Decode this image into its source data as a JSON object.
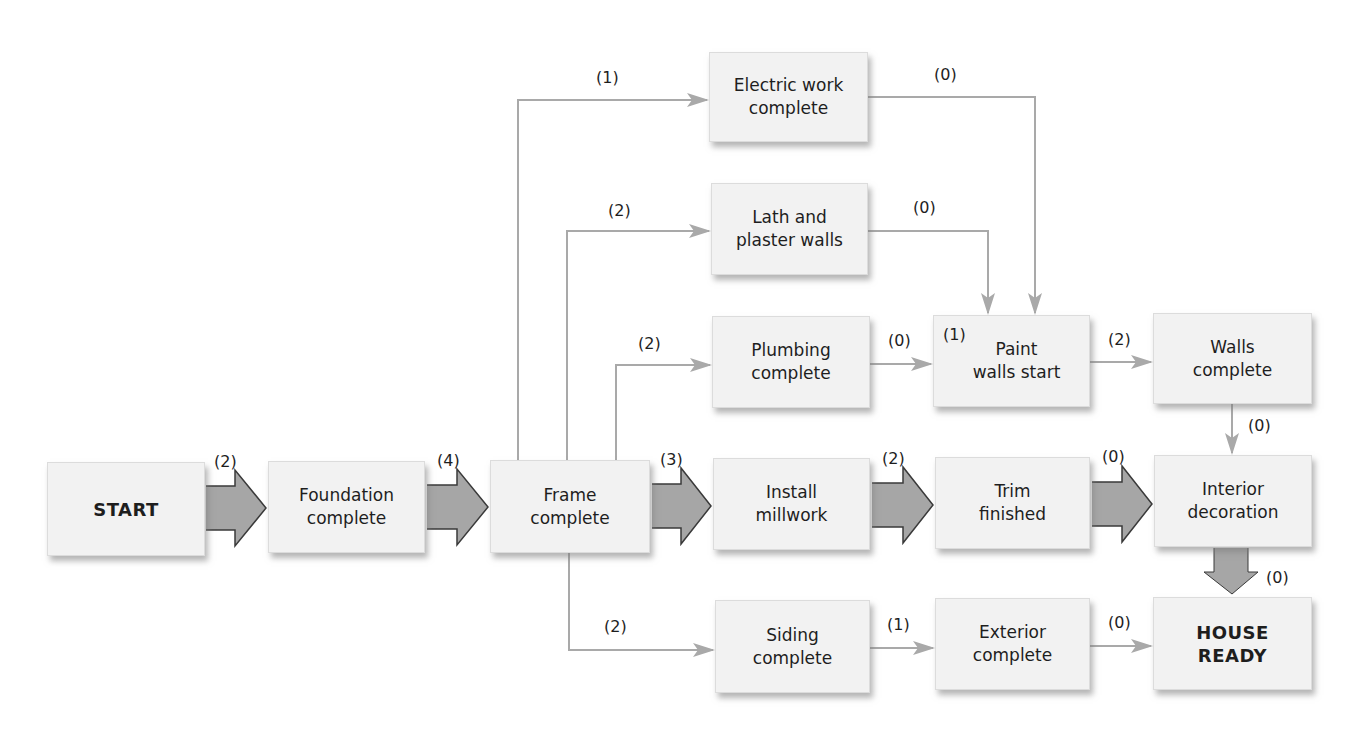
{
  "colors": {
    "box_fill": "#f2f2f2",
    "thin_line": "#a9a9a9",
    "fat_arrow_fill": "#a6a6a6",
    "fat_arrow_stroke": "#3a3a3a",
    "text": "#1e1e1e"
  },
  "nodes": [
    {
      "id": "start",
      "label": "START",
      "bold": true,
      "x": 47,
      "y": 462,
      "w": 158,
      "h": 94
    },
    {
      "id": "foundation",
      "label": "Foundation\ncomplete",
      "bold": false,
      "x": 268,
      "y": 461,
      "w": 157,
      "h": 92
    },
    {
      "id": "frame",
      "label": "Frame\ncomplete",
      "bold": false,
      "x": 490,
      "y": 460,
      "w": 160,
      "h": 93
    },
    {
      "id": "electric",
      "label": "Electric work\ncomplete",
      "bold": false,
      "x": 709,
      "y": 52,
      "w": 159,
      "h": 90
    },
    {
      "id": "lath",
      "label": "Lath and\nplaster walls",
      "bold": false,
      "x": 711,
      "y": 183,
      "w": 157,
      "h": 92
    },
    {
      "id": "plumbing",
      "label": "Plumbing\ncomplete",
      "bold": false,
      "x": 712,
      "y": 316,
      "w": 158,
      "h": 92
    },
    {
      "id": "paint",
      "label": "Paint\nwalls start",
      "bold": false,
      "x": 933,
      "y": 315,
      "w": 157,
      "h": 92
    },
    {
      "id": "walls",
      "label": "Walls\ncomplete",
      "bold": false,
      "x": 1153,
      "y": 313,
      "w": 159,
      "h": 91
    },
    {
      "id": "millwork",
      "label": "Install\nmillwork",
      "bold": false,
      "x": 713,
      "y": 458,
      "w": 157,
      "h": 92
    },
    {
      "id": "trim",
      "label": "Trim\nfinished",
      "bold": false,
      "x": 935,
      "y": 457,
      "w": 155,
      "h": 92
    },
    {
      "id": "interior",
      "label": "Interior\ndecoration",
      "bold": false,
      "x": 1154,
      "y": 455,
      "w": 158,
      "h": 92
    },
    {
      "id": "siding",
      "label": "Siding\ncomplete",
      "bold": false,
      "x": 715,
      "y": 600,
      "w": 155,
      "h": 93
    },
    {
      "id": "exterior",
      "label": "Exterior\ncomplete",
      "bold": false,
      "x": 935,
      "y": 598,
      "w": 155,
      "h": 92
    },
    {
      "id": "house_ready",
      "label": "HOUSE\nREADY",
      "bold": true,
      "x": 1153,
      "y": 597,
      "w": 159,
      "h": 93
    }
  ],
  "edges": [
    {
      "from": "start",
      "to": "foundation",
      "weight": "(2)",
      "style": "fat",
      "label_x": 214,
      "label_y": 452
    },
    {
      "from": "foundation",
      "to": "frame",
      "weight": "(4)",
      "style": "fat",
      "label_x": 437,
      "label_y": 451
    },
    {
      "from": "frame",
      "to": "millwork",
      "weight": "(3)",
      "style": "fat",
      "label_x": 660,
      "label_y": 450
    },
    {
      "from": "millwork",
      "to": "trim",
      "weight": "(2)",
      "style": "fat",
      "label_x": 882,
      "label_y": 449
    },
    {
      "from": "trim",
      "to": "interior",
      "weight": "(0)",
      "style": "fat",
      "label_x": 1102,
      "label_y": 447
    },
    {
      "from": "interior",
      "to": "house_ready",
      "weight": "(0)",
      "style": "fat-down",
      "label_x": 1266,
      "label_y": 577
    },
    {
      "from": "frame",
      "to": "electric",
      "weight": "(1)",
      "style": "thin",
      "label_x": 596,
      "label_y": 78
    },
    {
      "from": "frame",
      "to": "lath",
      "weight": "(2)",
      "style": "thin",
      "label_x": 608,
      "label_y": 211
    },
    {
      "from": "frame",
      "to": "plumbing",
      "weight": "(2)",
      "style": "thin",
      "label_x": 638,
      "label_y": 344
    },
    {
      "from": "frame",
      "to": "siding",
      "weight": "(2)",
      "style": "thin",
      "label_x": 604,
      "label_y": 627
    },
    {
      "from": "electric",
      "to": "paint",
      "weight": "(0)",
      "style": "thin",
      "label_x": 934,
      "label_y": 75
    },
    {
      "from": "lath",
      "to": "paint",
      "weight": "(0)",
      "style": "thin",
      "label_x": 913,
      "label_y": 208
    },
    {
      "from": "plumbing",
      "to": "paint",
      "weight": "(0)",
      "style": "thin",
      "label_x": 888,
      "label_y": 342
    },
    {
      "from": "paint",
      "to": "walls",
      "weight": "(2)",
      "style": "thin",
      "label_x": 1108,
      "label_y": 341
    },
    {
      "from": "walls",
      "to": "interior",
      "weight": "(0)",
      "style": "thin",
      "label_x": 1248,
      "label_y": 425
    },
    {
      "from": "siding",
      "to": "exterior",
      "weight": "(1)",
      "style": "thin",
      "label_x": 887,
      "label_y": 625
    },
    {
      "from": "exterior",
      "to": "house_ready",
      "weight": "(0)",
      "style": "thin",
      "label_x": 1108,
      "label_y": 623
    }
  ],
  "extra_labels": [
    {
      "id": "paint-inner-weight",
      "text": "(1)",
      "x": 943,
      "label_y": 342
    }
  ]
}
